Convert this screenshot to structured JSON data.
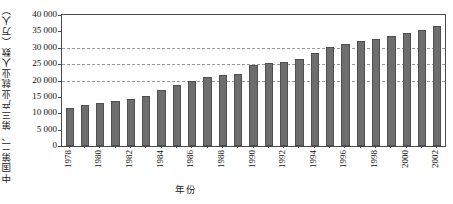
{
  "chart_data": {
    "type": "bar",
    "title": "",
    "subtitle": "",
    "xlabel": "年份",
    "ylabel": "中国第二、第三产业就业人数（万人）",
    "ylim": [
      0,
      40000
    ],
    "yticks": [
      0,
      5000,
      10000,
      15000,
      20000,
      25000,
      30000,
      35000,
      40000
    ],
    "ytick_labels": [
      "0",
      "5 000",
      "10 000",
      "15 000",
      "20 000",
      "25 000",
      "30 000",
      "35 000",
      "40 000"
    ],
    "grid": "horizontal-dashed-at-20000-25000-30000",
    "gridlines_at": [
      20000,
      25000,
      30000
    ],
    "legend": "none",
    "legend_position": "none",
    "bar_color": "#6e6e6e",
    "bar_edge_color": "#4f4f4f",
    "axis_color": "#4a4a4a",
    "gridline_color": "#9a9a9a",
    "categories": [
      "1978",
      "1979",
      "1980",
      "1981",
      "1982",
      "1983",
      "1984",
      "1985",
      "1986",
      "1987",
      "1988",
      "1989",
      "1990",
      "1991",
      "1992",
      "1993",
      "1994",
      "1995",
      "1996",
      "1997",
      "1998",
      "1999",
      "2000",
      "2001",
      "2002"
    ],
    "xtick_labels_shown": [
      "1978",
      "1980",
      "1982",
      "1984",
      "1986",
      "1988",
      "1990",
      "1992",
      "1994",
      "1996",
      "1998",
      "2000",
      "2002"
    ],
    "values": [
      11700,
      12600,
      13200,
      13800,
      14400,
      15200,
      17200,
      18700,
      19700,
      21000,
      21800,
      22000,
      24800,
      25300,
      25700,
      26600,
      28500,
      30300,
      31200,
      32200,
      32800,
      33600,
      34400,
      35300,
      36600
    ],
    "units": "万人"
  }
}
